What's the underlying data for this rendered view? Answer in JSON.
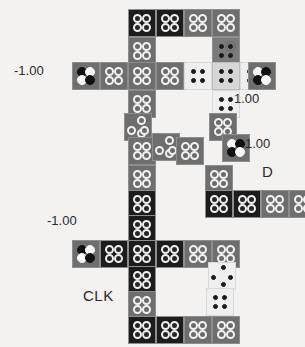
{
  "diagram": {
    "cell_size": 28,
    "background_color": "#f3f2f0",
    "labels": [
      {
        "name": "polarization-top-left",
        "text": "-1.00",
        "x": 14,
        "y": 64,
        "style": "lbl-num"
      },
      {
        "name": "signal-q",
        "text": "Q",
        "x": 225,
        "y": 38,
        "style": "lbl-q"
      },
      {
        "name": "polarization-right-top",
        "text": "1.00",
        "x": 234,
        "y": 92,
        "style": "lbl-num"
      },
      {
        "name": "polarization-right-mid",
        "text": "1.00",
        "x": 245,
        "y": 137,
        "style": "lbl-num"
      },
      {
        "name": "signal-d",
        "text": "D",
        "x": 262,
        "y": 164,
        "style": "lbl-d"
      },
      {
        "name": "polarization-bottom-left",
        "text": "-1.00",
        "x": 47,
        "y": 214,
        "style": "lbl-num"
      },
      {
        "name": "signal-clk",
        "text": "CLK",
        "x": 83,
        "y": 288,
        "style": "lbl-clk"
      }
    ],
    "cells": [
      {
        "n": "cell-r0c0",
        "x": 128,
        "y": 9,
        "shade": "sh-dark",
        "dots": "ringd-square"
      },
      {
        "n": "cell-r0c1",
        "x": 156,
        "y": 9,
        "shade": "sh-dark",
        "dots": "ringd-square"
      },
      {
        "n": "cell-r0c2",
        "x": 184,
        "y": 9,
        "shade": "sh-mid",
        "dots": "ring-square"
      },
      {
        "n": "cell-r0c3",
        "x": 212,
        "y": 9,
        "shade": "sh-mid",
        "dots": "ring-square"
      },
      {
        "n": "cell-r1c0",
        "x": 128,
        "y": 37,
        "shade": "sh-mid",
        "dots": "ring-square"
      },
      {
        "n": "cell-r1c3",
        "x": 212,
        "y": 37,
        "shade": "sh-mid2",
        "dots": "small-square"
      },
      {
        "n": "cell-r2c-2",
        "x": 72,
        "y": 62,
        "shade": "sh-mid",
        "dots": "bw-diag"
      },
      {
        "n": "cell-r2c-1",
        "x": 100,
        "y": 62,
        "shade": "sh-mid",
        "dots": "ring-square"
      },
      {
        "n": "cell-r2c0",
        "x": 128,
        "y": 62,
        "shade": "sh-mid",
        "dots": "ring-square"
      },
      {
        "n": "cell-r2c1",
        "x": 156,
        "y": 62,
        "shade": "sh-mid",
        "dots": "ring-square"
      },
      {
        "n": "cell-r2c2",
        "x": 184,
        "y": 62,
        "shade": "sh-pale",
        "dots": "small-square"
      },
      {
        "n": "cell-r2c3",
        "x": 212,
        "y": 62,
        "shade": "sh-light",
        "dots": "small-square"
      },
      {
        "n": "cell-r2c4",
        "x": 240,
        "y": 62,
        "shade": "sh-pale",
        "dots": "small-square"
      },
      {
        "n": "cell-r2c5",
        "x": 248,
        "y": 62,
        "shade": "sh-mid",
        "dots": "wb-diag"
      },
      {
        "n": "cell-r3c0",
        "x": 128,
        "y": 90,
        "shade": "sh-mid",
        "dots": "ring-square"
      },
      {
        "n": "cell-r3c3",
        "x": 212,
        "y": 90,
        "shade": "sh-pale",
        "dots": "small-square"
      },
      {
        "n": "cell-r4c0",
        "x": 124,
        "y": 113,
        "shade": "sh-mid",
        "dots": "ring-diamond"
      },
      {
        "n": "cell-r4c3",
        "x": 209,
        "y": 113,
        "shade": "sh-mid",
        "dots": "ring-square"
      },
      {
        "n": "cell-r5c0",
        "x": 128,
        "y": 137,
        "shade": "sh-mid",
        "dots": "ring-square"
      },
      {
        "n": "cell-r5c1",
        "x": 152,
        "y": 133,
        "shade": "sh-mid",
        "dots": "ring-diamond"
      },
      {
        "n": "cell-r5c2",
        "x": 176,
        "y": 137,
        "shade": "sh-mid",
        "dots": "ring-square"
      },
      {
        "n": "cell-r5c4",
        "x": 222,
        "y": 134,
        "shade": "sh-mid",
        "dots": "wb-diag"
      },
      {
        "n": "cell-r6c0",
        "x": 128,
        "y": 165,
        "shade": "sh-mid",
        "dots": "ring-square"
      },
      {
        "n": "cell-r6c3",
        "x": 205,
        "y": 165,
        "shade": "sh-mid",
        "dots": "ring-square"
      },
      {
        "n": "cell-r7c0",
        "x": 128,
        "y": 190,
        "shade": "sh-dark",
        "dots": "ringd-square"
      },
      {
        "n": "cell-r7c3",
        "x": 205,
        "y": 190,
        "shade": "sh-dark",
        "dots": "ringd-square"
      },
      {
        "n": "cell-r7c4",
        "x": 233,
        "y": 190,
        "shade": "sh-dark",
        "dots": "ringd-square"
      },
      {
        "n": "cell-r7c5",
        "x": 261,
        "y": 190,
        "shade": "sh-mid",
        "dots": "ring-square"
      },
      {
        "n": "cell-r7c6",
        "x": 289,
        "y": 190,
        "shade": "sh-mid",
        "dots": "ring-square"
      },
      {
        "n": "cell-r8c0",
        "x": 128,
        "y": 215,
        "shade": "sh-dark",
        "dots": "ringd-square"
      },
      {
        "n": "cell-r9c-2",
        "x": 72,
        "y": 240,
        "shade": "sh-mid",
        "dots": "bw-diag"
      },
      {
        "n": "cell-r9c-1",
        "x": 100,
        "y": 240,
        "shade": "sh-dark",
        "dots": "ringd-square"
      },
      {
        "n": "cell-r9c0",
        "x": 128,
        "y": 240,
        "shade": "sh-dark",
        "dots": "ringd-square"
      },
      {
        "n": "cell-r9c1",
        "x": 156,
        "y": 240,
        "shade": "sh-dark",
        "dots": "ringd-square"
      },
      {
        "n": "cell-r9c2",
        "x": 184,
        "y": 240,
        "shade": "sh-mid",
        "dots": "ring-square"
      },
      {
        "n": "cell-r9c3",
        "x": 212,
        "y": 240,
        "shade": "sh-mid",
        "dots": "ring-square"
      },
      {
        "n": "cell-r10c0",
        "x": 128,
        "y": 266,
        "shade": "sh-dark",
        "dots": "ringd-square"
      },
      {
        "n": "cell-r10c3",
        "x": 208,
        "y": 262,
        "shade": "sh-pale",
        "dots": "small-diamond"
      },
      {
        "n": "cell-r11c0",
        "x": 128,
        "y": 291,
        "shade": "sh-mid",
        "dots": "ring-square"
      },
      {
        "n": "cell-r11c3",
        "x": 206,
        "y": 288,
        "shade": "sh-pale",
        "dots": "small-square"
      },
      {
        "n": "cell-r12c0",
        "x": 128,
        "y": 316,
        "shade": "sh-dark",
        "dots": "ringd-square"
      },
      {
        "n": "cell-r12c1",
        "x": 156,
        "y": 316,
        "shade": "sh-dark",
        "dots": "ringd-square"
      },
      {
        "n": "cell-r12c2",
        "x": 184,
        "y": 316,
        "shade": "sh-mid",
        "dots": "ring-square"
      },
      {
        "n": "cell-r12c3",
        "x": 212,
        "y": 316,
        "shade": "sh-mid",
        "dots": "ring-square"
      }
    ]
  }
}
